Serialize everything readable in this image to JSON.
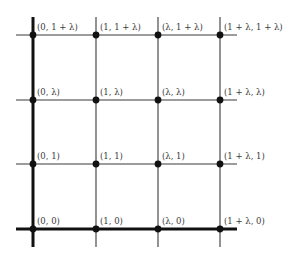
{
  "diagram": {
    "type": "lattice-grid",
    "colors": {
      "line": "#3a3a3a",
      "axis": "#111111",
      "point": "#111111",
      "label": "#3a3a3a"
    },
    "columns": [
      {
        "name": "x-0",
        "value": "0",
        "px": 33,
        "axis": true
      },
      {
        "name": "x-1",
        "value": "1",
        "px": 96,
        "axis": false
      },
      {
        "name": "x-lambda",
        "value": "λ",
        "px": 158,
        "axis": false
      },
      {
        "name": "x-1-plus-lambda",
        "value": "1 + λ",
        "px": 220,
        "axis": false
      }
    ],
    "rows": [
      {
        "name": "y-1-plus-lambda",
        "value": "1 + λ",
        "px": 35,
        "axis": false
      },
      {
        "name": "y-lambda",
        "value": "λ",
        "px": 100,
        "axis": false
      },
      {
        "name": "y-1",
        "value": "1",
        "px": 164,
        "axis": false
      },
      {
        "name": "y-0",
        "value": "0",
        "px": 229,
        "axis": true
      }
    ],
    "extent": {
      "h_x1": 16,
      "h_x2": 237,
      "v_y1": 17,
      "v_y2": 247
    },
    "points": [
      {
        "label": "(0, 1 + λ)",
        "col": 0,
        "row": 0
      },
      {
        "label": "(1, 1 + λ)",
        "col": 1,
        "row": 0
      },
      {
        "label": "(λ, 1 + λ)",
        "col": 2,
        "row": 0
      },
      {
        "label": "(1 + λ, 1 + λ)",
        "col": 3,
        "row": 0
      },
      {
        "label": "(0, λ)",
        "col": 0,
        "row": 1
      },
      {
        "label": "(1, λ)",
        "col": 1,
        "row": 1
      },
      {
        "label": "(λ, λ)",
        "col": 2,
        "row": 1
      },
      {
        "label": "(1 + λ, λ)",
        "col": 3,
        "row": 1
      },
      {
        "label": "(0, 1)",
        "col": 0,
        "row": 2
      },
      {
        "label": "(1, 1)",
        "col": 1,
        "row": 2
      },
      {
        "label": "(λ, 1)",
        "col": 2,
        "row": 2
      },
      {
        "label": "(1 + λ, 1)",
        "col": 3,
        "row": 2
      },
      {
        "label": "(0, 0)",
        "col": 0,
        "row": 3
      },
      {
        "label": "(1, 0)",
        "col": 1,
        "row": 3
      },
      {
        "label": "(λ, 0)",
        "col": 2,
        "row": 3
      },
      {
        "label": "(1 + λ, 0)",
        "col": 3,
        "row": 3
      }
    ]
  }
}
